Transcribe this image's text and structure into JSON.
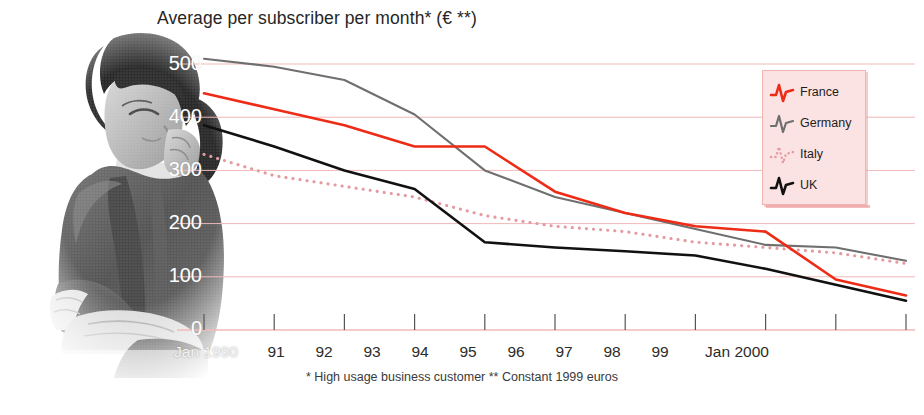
{
  "title": "Average per subscriber per month* (€ **)",
  "footnote": "* High usage business customer  ** Constant 1999 euros",
  "legend": {
    "items": [
      {
        "label": "France",
        "color": "#ee2b16",
        "style": "solid"
      },
      {
        "label": "Germany",
        "color": "#6f6f6f",
        "style": "solid"
      },
      {
        "label": "Italy",
        "color": "#e39aa0",
        "style": "dotted"
      },
      {
        "label": "UK",
        "color": "#111111",
        "style": "solid"
      }
    ],
    "background": "#fbe3e3",
    "border": "#f2b3b3"
  },
  "axes": {
    "y_ticks": [
      "500",
      "400",
      "300",
      "200",
      "100",
      "0"
    ],
    "x_ticks": [
      "Jan 1990",
      "91",
      "92",
      "93",
      "94",
      "95",
      "96",
      "97",
      "98",
      "99",
      "Jan 2000"
    ],
    "grid_color": "#f0b9b9",
    "axis_color": "#555555"
  },
  "chart_data": {
    "type": "line",
    "title": "Average per subscriber per month* (€ **)",
    "xlabel": "",
    "ylabel": "",
    "ylim": [
      0,
      500
    ],
    "grid": true,
    "legend_position": "top-right",
    "annotations": [
      "* High usage business customer",
      "** Constant 1999 euros"
    ],
    "x": [
      "Jan 1990",
      "91",
      "92",
      "93",
      "94",
      "95",
      "96",
      "97",
      "98",
      "99",
      "Jan 2000"
    ],
    "categories": [
      "Jan 1990",
      "91",
      "92",
      "93",
      "94",
      "95",
      "96",
      "97",
      "98",
      "99",
      "Jan 2000"
    ],
    "series": [
      {
        "name": "France",
        "color": "#ee2b16",
        "style": "solid",
        "values": [
          445,
          415,
          385,
          345,
          345,
          260,
          220,
          195,
          185,
          95,
          65
        ]
      },
      {
        "name": "Germany",
        "color": "#6f6f6f",
        "style": "solid",
        "values": [
          510,
          495,
          470,
          405,
          300,
          250,
          220,
          190,
          160,
          155,
          130
        ]
      },
      {
        "name": "Italy",
        "color": "#e39aa0",
        "style": "dotted",
        "values": [
          330,
          290,
          270,
          250,
          215,
          195,
          185,
          165,
          155,
          145,
          125
        ]
      },
      {
        "name": "UK",
        "color": "#111111",
        "style": "solid",
        "values": [
          385,
          345,
          300,
          265,
          165,
          155,
          148,
          140,
          115,
          85,
          55
        ]
      }
    ]
  }
}
